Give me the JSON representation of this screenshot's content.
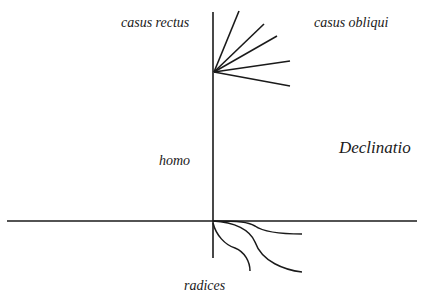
{
  "diagram": {
    "title": "",
    "labels": {
      "casus_rectus": "casus rectus",
      "casus_obliqui": "casus obliqui",
      "declinatio": "Declinatio",
      "homo": "homo",
      "radices": "radices"
    },
    "colors": {
      "line": "#1a1a1a",
      "background": "#ffffff"
    },
    "structure": {
      "vertical_axis": {
        "x": 213,
        "y1": 12,
        "y2": 258
      },
      "horizontal_axis": {
        "y": 221,
        "x1": 7,
        "x2": 417
      },
      "branch_origin": {
        "x": 214,
        "y": 72
      },
      "branches": [
        {
          "x": 239,
          "y": 11
        },
        {
          "x": 264,
          "y": 24
        },
        {
          "x": 277,
          "y": 36
        },
        {
          "x": 290,
          "y": 61
        },
        {
          "x": 290,
          "y": 86
        }
      ],
      "roots": [
        "M213,221 C240,221 248,222 255,226 C262,231 280,234 302,234",
        "M213,221 C235,222 250,230 255,242 C262,262 285,270 302,272",
        "M213,223 C216,235 225,245 235,248 C245,252 250,262 250,271"
      ]
    }
  }
}
